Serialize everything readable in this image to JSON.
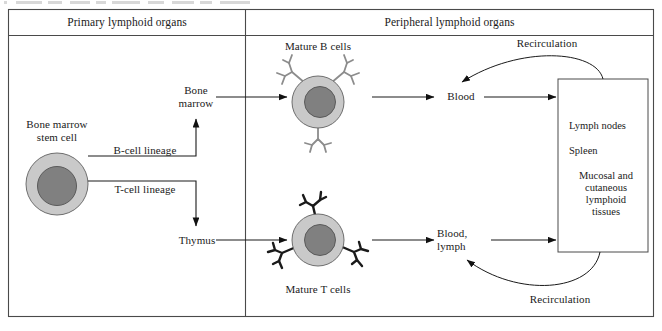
{
  "figure": {
    "type": "flow-diagram"
  },
  "panels": {
    "primary": {
      "title": "Primary lymphoid organs"
    },
    "peripheral": {
      "title": "Peripheral lymphoid organs"
    }
  },
  "nodes": {
    "stem_cell": {
      "label": "Bone marrow\nstem cell"
    },
    "bone_marrow": {
      "label": "Bone\nmarrow"
    },
    "thymus": {
      "label": "Thymus"
    },
    "mature_b": {
      "label": "Mature B cells"
    },
    "mature_t": {
      "label": "Mature T cells"
    },
    "blood": {
      "label": "Blood"
    },
    "blood_lymph": {
      "label": "Blood,\nlymph"
    }
  },
  "edges": {
    "b_lineage": {
      "label": "B-cell lineage"
    },
    "t_lineage": {
      "label": "T-cell lineage"
    },
    "recirculation_top": {
      "label": "Recirculation"
    },
    "recirculation_bottom": {
      "label": "Recirculation"
    }
  },
  "organ_box": {
    "items": [
      "Lymph nodes",
      "Spleen",
      "Mucosal and\ncutaneous\nlymphoid\ntissues"
    ]
  },
  "colors": {
    "cytoplasm": "#c9c9c9",
    "nucleus": "#808080",
    "cell_outline": "#5a5a5a",
    "b_receptor": "#8c8c8c",
    "t_receptor": "#1a1a1a",
    "frame": "#4a4a4a",
    "arrow": "#111111",
    "background": "#ffffff"
  }
}
